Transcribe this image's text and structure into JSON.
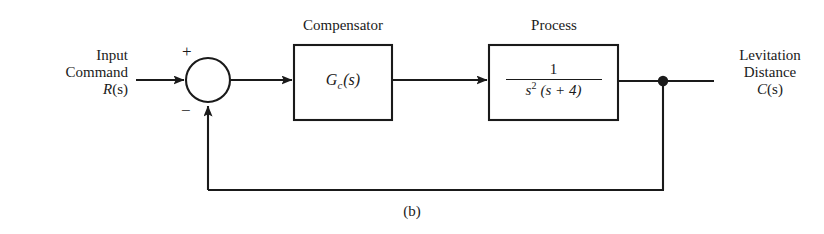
{
  "figure": {
    "caption": "(b)",
    "type": "control-system-block-diagram"
  },
  "input": {
    "line1": "Input",
    "line2": "Command",
    "line3_var": "R",
    "line3_arg": "(s)"
  },
  "output": {
    "line1": "Levitation",
    "line2": "Distance",
    "line3_var": "C",
    "line3_arg": "(s)"
  },
  "summing_junction": {
    "name": "summing-junction",
    "plus_sign": "+",
    "minus_sign": "−"
  },
  "blocks": [
    {
      "title": "Compensator",
      "fn_var": "G",
      "fn_sub": "c",
      "fn_arg": "(s)"
    },
    {
      "title": "Process",
      "numerator": "1",
      "den_var": "s",
      "den_exp": "2",
      "den_rest": "(s + 4)"
    }
  ],
  "colors": {
    "ink": "#1a1a1a",
    "background": "#ffffff"
  }
}
